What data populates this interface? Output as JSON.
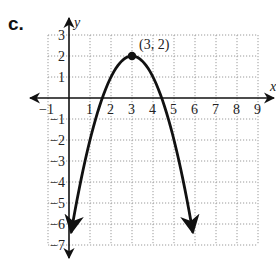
{
  "header": {
    "part_label": "c."
  },
  "chart_data": {
    "type": "line",
    "title": "",
    "function": "y = -(x - 3)^2 + 2",
    "xlabel": "x",
    "ylabel": "y",
    "xlim": [
      -1,
      9
    ],
    "ylim": [
      -7,
      3
    ],
    "grid": true,
    "grid_style": "dotted",
    "x_ticks": [
      "-1",
      "1",
      "2",
      "3",
      "4",
      "5",
      "6",
      "7",
      "8",
      "9"
    ],
    "y_ticks": [
      "3",
      "2",
      "1",
      "-1",
      "-2",
      "-3",
      "-4",
      "-5",
      "-6",
      "-7"
    ],
    "series": [
      {
        "name": "parabola",
        "x": [
          0.1,
          0.5,
          1,
          1.5,
          2,
          2.5,
          3,
          3.5,
          4,
          4.5,
          5,
          5.5,
          5.9
        ],
        "values": [
          -6.41,
          -4.25,
          -2,
          -0.25,
          1,
          1.75,
          2,
          1.75,
          1,
          -0.25,
          -2,
          -4.25,
          -6.41
        ],
        "arrows_at_ends": true,
        "color": "#111111"
      }
    ],
    "annotations": [
      {
        "point": [
          3,
          2
        ],
        "label": "(3, 2)",
        "marker": "filled-circle"
      }
    ]
  }
}
